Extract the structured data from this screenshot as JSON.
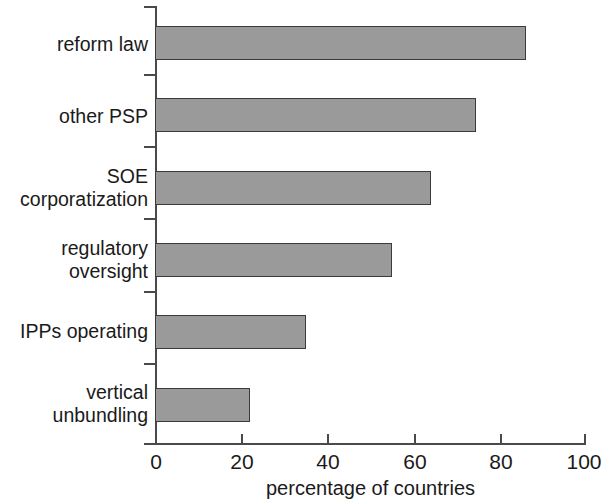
{
  "chart_data": {
    "type": "bar",
    "orientation": "horizontal",
    "title": "",
    "xlabel": "percentage of countries",
    "ylabel": "",
    "categories": [
      "reform law",
      "other PSP",
      "SOE\ncorporatization",
      "regulatory\noversight",
      "IPPs operating",
      "vertical\nunbundling"
    ],
    "values": [
      86,
      74.5,
      64,
      55,
      35,
      22
    ],
    "xlim": [
      0,
      100
    ],
    "xticks": [
      0,
      20,
      40,
      60,
      80,
      100
    ],
    "xtick_labels": [
      "0",
      "20",
      "40",
      "60",
      "80",
      "100"
    ],
    "grid": false,
    "legend": null,
    "bar_fill_color": "#9a9a9a",
    "bar_edge_color": "#3b3b3b",
    "axis_color": "#4a4a4a",
    "background_color": "#ffffff"
  }
}
